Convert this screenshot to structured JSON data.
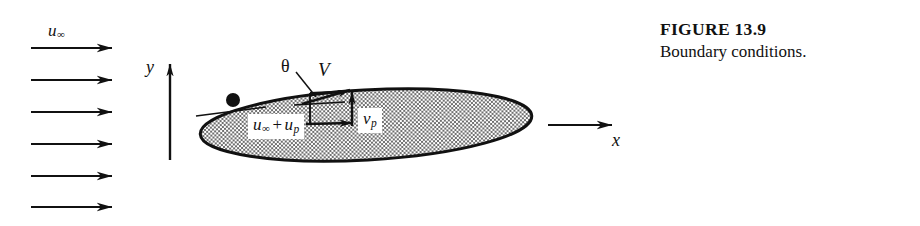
{
  "figure": {
    "caption_title": "FIGURE 13.9",
    "caption_text": "Boundary conditions.",
    "colors": {
      "ink": "#111111",
      "body_fill_gray": "#9a9a9a",
      "background": "#ffffff"
    }
  },
  "axes": {
    "x_label": "x",
    "y_label": "y"
  },
  "freestream": {
    "label_symbol": "u",
    "label_subscript": "∞",
    "arrow_count": 6,
    "direction": "right"
  },
  "body": {
    "shape": "ellipse",
    "description_label": "airfoil-body"
  },
  "vectors": {
    "resultant_label": "V",
    "angle_label": "θ",
    "horizontal_component": {
      "symbol_1": "u",
      "subscript_1": "∞",
      "operator": "+",
      "symbol_2": "u",
      "subscript_2": "p"
    },
    "vertical_component": {
      "symbol": "v",
      "subscript": "p"
    }
  }
}
